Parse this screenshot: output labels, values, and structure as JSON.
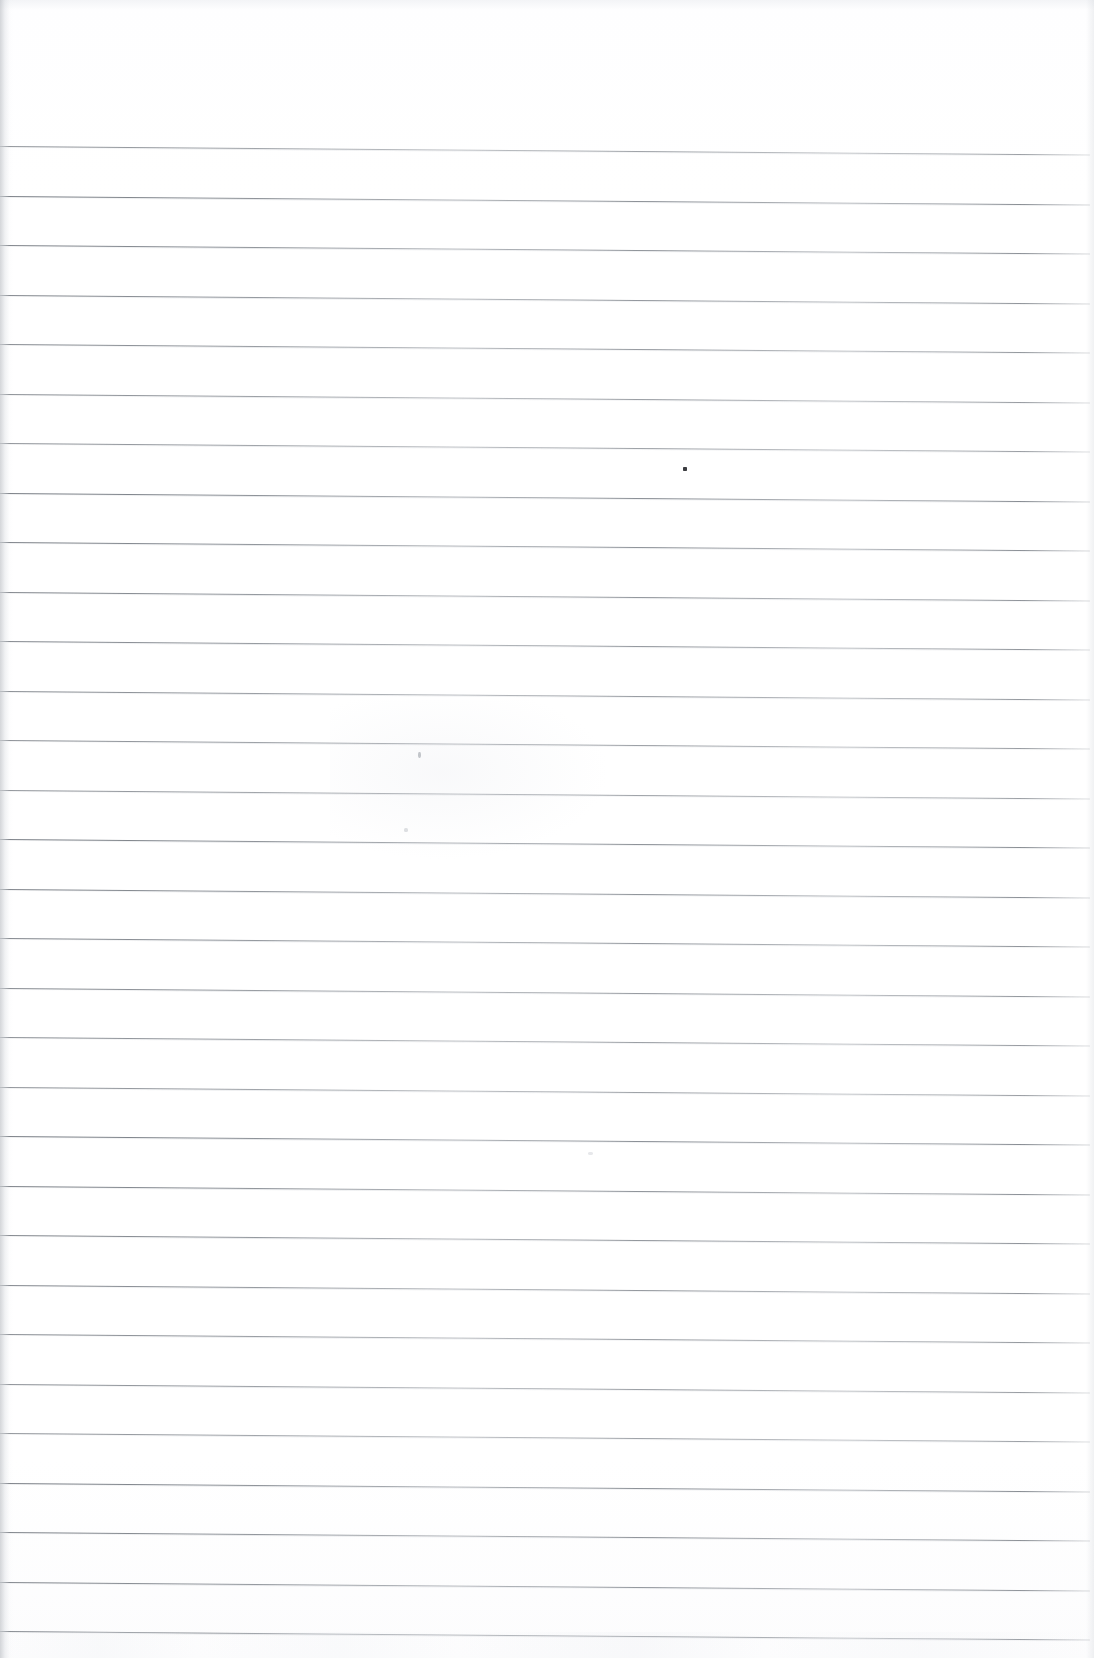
{
  "document": {
    "kind": "scanned-page",
    "page_type": "lined-notebook-paper",
    "title": "Blank Lined Page",
    "written_content": "",
    "written_lines": [],
    "has_handwriting": false,
    "has_header_text": false,
    "has_page_number": false,
    "has_margin_rule": false
  },
  "paper": {
    "background_color": "#ffffff",
    "rule_color": "#6a7078",
    "rule_color_light": "#bcc0c6",
    "edge_shadow_color": "#b0b4ba",
    "width_px": 1094,
    "height_px": 1658
  },
  "ruling": {
    "line_count": 31,
    "first_line_y": 146,
    "line_spacing_px": 49.5,
    "line_left_x": 0,
    "line_right_x": 1090,
    "line_thickness_px": 1,
    "tilt_degrees": 0.45,
    "top_margin_px": 146,
    "bottom_margin_px": 26,
    "line_y_positions": [
      146,
      195.5,
      245,
      294.5,
      344,
      393.5,
      443,
      492.5,
      542,
      591.5,
      641,
      690.5,
      740,
      789.5,
      839,
      888.5,
      938,
      987.5,
      1037,
      1086.5,
      1136,
      1185.5,
      1235,
      1284.5,
      1334,
      1383.5,
      1433,
      1482.5,
      1532,
      1581.5,
      1631
    ]
  },
  "artifacts": {
    "specks": [
      {
        "name": "ink-dot",
        "x": 683,
        "y": 467,
        "w": 4,
        "h": 4
      },
      {
        "name": "faint-tick",
        "x": 418,
        "y": 752,
        "w": 3,
        "h": 6
      },
      {
        "name": "faint-speck",
        "x": 404,
        "y": 828,
        "w": 4,
        "h": 4
      },
      {
        "name": "faint-smudge",
        "x": 588,
        "y": 1152,
        "w": 5,
        "h": 3
      }
    ]
  }
}
